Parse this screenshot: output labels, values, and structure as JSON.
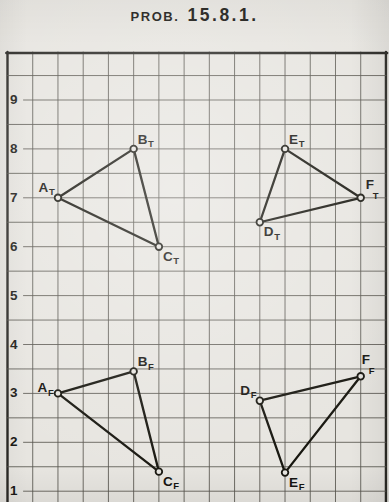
{
  "title": {
    "prefix": "PROB.",
    "number": "15.8.1."
  },
  "colors": {
    "paper": "#e7e5e0",
    "grid": "#57554e",
    "border": "#2b2a26",
    "ink": "#17160f"
  },
  "axis": {
    "tick_values": [
      9,
      8,
      7,
      6,
      5,
      4,
      3,
      2,
      1
    ]
  },
  "grid": {
    "columns": 15,
    "units_per_square": 0.5,
    "y_minor_top": 9.5,
    "y_minor_bottom": 1.0
  },
  "chart_data": {
    "type": "scatter",
    "points": [
      {
        "id": "AT",
        "letter": "A",
        "sub": "T",
        "x": 2,
        "y": 7,
        "label_pos": "nw"
      },
      {
        "id": "BT",
        "letter": "B",
        "sub": "T",
        "x": 5,
        "y": 8,
        "label_pos": "ne"
      },
      {
        "id": "CT",
        "letter": "C",
        "sub": "T",
        "x": 6,
        "y": 6,
        "label_pos": "se"
      },
      {
        "id": "DT",
        "letter": "D",
        "sub": "T",
        "x": 10,
        "y": 6.5,
        "label_pos": "se"
      },
      {
        "id": "ET",
        "letter": "E",
        "sub": "T",
        "x": 11,
        "y": 8,
        "label_pos": "ne"
      },
      {
        "id": "FT",
        "letter": "F",
        "sub": "T",
        "x": 14,
        "y": 7,
        "label_pos": "stack-ne"
      },
      {
        "id": "AF",
        "letter": "A",
        "sub": "F",
        "x": 2,
        "y": 3,
        "label_pos": "w"
      },
      {
        "id": "BF",
        "letter": "B",
        "sub": "F",
        "x": 5,
        "y": 3.45,
        "label_pos": "ne"
      },
      {
        "id": "CF",
        "letter": "C",
        "sub": "F",
        "x": 6,
        "y": 1.4,
        "label_pos": "se"
      },
      {
        "id": "DF",
        "letter": "D",
        "sub": "F",
        "x": 10,
        "y": 2.85,
        "label_pos": "nw"
      },
      {
        "id": "EF",
        "letter": "E",
        "sub": "F",
        "x": 11,
        "y": 1.38,
        "label_pos": "se"
      },
      {
        "id": "FF",
        "letter": "F",
        "sub": "F",
        "x": 14,
        "y": 3.35,
        "label_pos": "stack-n"
      }
    ],
    "edges": [
      [
        "AT",
        "BT"
      ],
      [
        "BT",
        "CT"
      ],
      [
        "CT",
        "AT"
      ],
      [
        "DT",
        "ET"
      ],
      [
        "ET",
        "FT"
      ],
      [
        "FT",
        "DT"
      ],
      [
        "AF",
        "BF"
      ],
      [
        "BF",
        "CF"
      ],
      [
        "CF",
        "AF"
      ],
      [
        "DF",
        "EF"
      ],
      [
        "EF",
        "FF"
      ],
      [
        "FF",
        "DF"
      ]
    ]
  }
}
